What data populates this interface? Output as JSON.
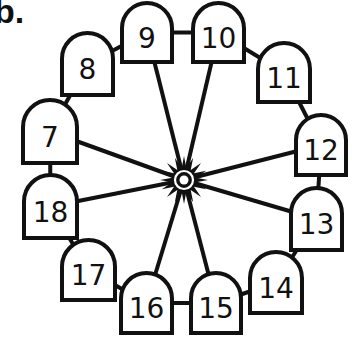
{
  "problem_label": "b.",
  "diagram": {
    "type": "ferris-wheel",
    "hub": {
      "cx": 184,
      "cy": 180
    },
    "gondolas": [
      {
        "number": "9",
        "x": 122,
        "y": 3,
        "w": 50,
        "h": 59
      },
      {
        "number": "10",
        "x": 193,
        "y": 3,
        "w": 51,
        "h": 59
      },
      {
        "number": "11",
        "x": 258,
        "y": 43,
        "w": 52,
        "h": 59
      },
      {
        "number": "12",
        "x": 296,
        "y": 115,
        "w": 50,
        "h": 60
      },
      {
        "number": "13",
        "x": 291,
        "y": 188,
        "w": 51,
        "h": 62
      },
      {
        "number": "14",
        "x": 250,
        "y": 252,
        "w": 52,
        "h": 61
      },
      {
        "number": "15",
        "x": 191,
        "y": 273,
        "w": 50,
        "h": 60
      },
      {
        "number": "16",
        "x": 121,
        "y": 273,
        "w": 51,
        "h": 60
      },
      {
        "number": "17",
        "x": 62,
        "y": 240,
        "w": 53,
        "h": 60
      },
      {
        "number": "18",
        "x": 24,
        "y": 175,
        "w": 53,
        "h": 63
      },
      {
        "number": "7",
        "x": 23,
        "y": 100,
        "w": 54,
        "h": 63
      },
      {
        "number": "8",
        "x": 62,
        "y": 33,
        "w": 51,
        "h": 62
      }
    ],
    "spokes_to": [
      "9",
      "10",
      "12",
      "13",
      "15",
      "16",
      "18",
      "7"
    ],
    "colors": {
      "stroke": "#111111",
      "fill": "#ffffff"
    }
  }
}
